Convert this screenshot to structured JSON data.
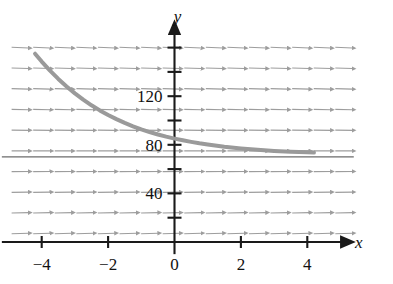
{
  "figure": {
    "name": "slope-field-with-solution-curve",
    "background_color": "#ffffff"
  },
  "axes": {
    "x_axis_label": "x",
    "y_axis_label": "y",
    "x_axis_color": "#1a1a1a",
    "y_axis_color": "#1a1a1a",
    "x_ticks": [
      {
        "value": -4,
        "label": "−4"
      },
      {
        "value": -2,
        "label": "−2"
      },
      {
        "value": 0,
        "label": "0"
      },
      {
        "value": 2,
        "label": "2"
      },
      {
        "value": 4,
        "label": "4"
      }
    ],
    "y_ticks": [
      {
        "value": 20,
        "label": ""
      },
      {
        "value": 40,
        "label": "40"
      },
      {
        "value": 60,
        "label": ""
      },
      {
        "value": 80,
        "label": "80"
      },
      {
        "value": 100,
        "label": ""
      },
      {
        "value": 120,
        "label": "120"
      },
      {
        "value": 140,
        "label": ""
      },
      {
        "value": 160,
        "label": ""
      }
    ],
    "xlim": [
      -5.2,
      5.6
    ],
    "ylim": [
      -12,
      180
    ]
  },
  "chart_data": {
    "type": "line",
    "title": "",
    "xlabel": "x",
    "ylabel": "y",
    "xlim": [
      -5.2,
      5.6
    ],
    "ylim": [
      -12,
      180
    ],
    "grid": false,
    "legend": "none",
    "asymptote": {
      "name": "equilibrium-line",
      "y_value": 70,
      "color": "#6b6b6b",
      "x_from": -5.2,
      "x_to": 5.4
    },
    "series": [
      {
        "name": "solution-curve",
        "color": "#9a9a9a",
        "line_width": 4,
        "x": [
          -4.2,
          -4.0,
          -3.75,
          -3.5,
          -3.25,
          -3.0,
          -2.75,
          -2.5,
          -2.25,
          -2.0,
          -1.75,
          -1.5,
          -1.25,
          -1.0,
          -0.75,
          -0.5,
          -0.25,
          0.0,
          0.25,
          0.5,
          0.75,
          1.0,
          1.5,
          2.0,
          2.5,
          3.0,
          3.5,
          4.0,
          4.2
        ],
        "y": [
          155.0,
          148.5,
          141.0,
          134.2,
          128.0,
          122.3,
          117.2,
          112.5,
          108.3,
          104.5,
          101.1,
          98.0,
          95.2,
          92.7,
          90.5,
          88.5,
          86.7,
          85.1,
          83.7,
          82.4,
          81.2,
          80.2,
          78.4,
          77.0,
          75.9,
          75.0,
          74.3,
          73.8,
          73.6
        ]
      }
    ],
    "slope_field": {
      "name": "direction-field",
      "color": "#8d8d8d",
      "arrow_color": "#8d8d8d",
      "equilibrium_y": 70,
      "decay_rate": 0.013,
      "x_values": [
        -4.65,
        -4.0,
        -3.35,
        -2.7,
        -2.05,
        -1.4,
        -0.75,
        -0.1,
        0.55,
        1.2,
        1.85,
        2.5,
        3.15,
        3.8,
        4.45,
        5.1
      ],
      "y_values": [
        160,
        143,
        126,
        109,
        92,
        75,
        58,
        41,
        24,
        7
      ],
      "segment_length": 17
    }
  }
}
